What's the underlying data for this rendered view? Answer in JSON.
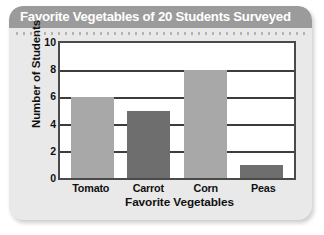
{
  "card": {
    "title": "Favorite Vegetables of 20 Students Surveyed",
    "background_color": "#e9e9e9",
    "titlebar_color": "#9b9b9b",
    "title_text_color": "#ffffff"
  },
  "chart_data": {
    "type": "bar",
    "title": "Favorite Vegetables of 20 Students Surveyed",
    "xlabel": "Favorite Vegetables",
    "ylabel": "Number of Students",
    "categories": [
      "Tomato",
      "Carrot",
      "Corn",
      "Peas"
    ],
    "values": [
      6,
      5,
      8,
      1
    ],
    "bar_colors": [
      "#a8a8a8",
      "#6e6e6e",
      "#a8a8a8",
      "#6e6e6e"
    ],
    "ylim": [
      0,
      10
    ],
    "yticks": [
      10,
      8,
      6,
      4,
      2,
      0
    ],
    "grid": "horizontal",
    "legend": "none",
    "plot_background": "#ffffff",
    "frame_color": "#4a4a4a",
    "gridline_color": "#3c3c3c"
  }
}
